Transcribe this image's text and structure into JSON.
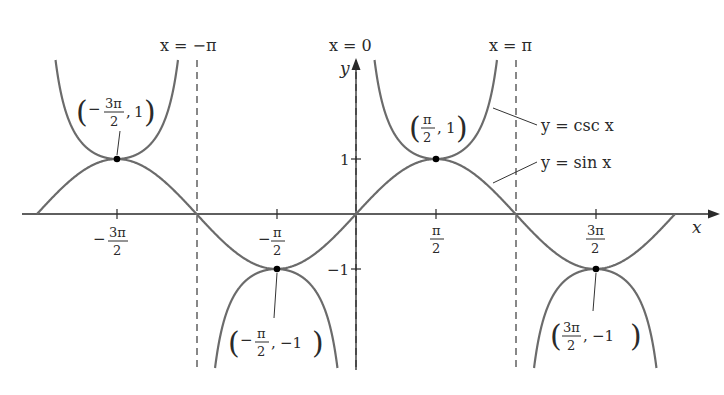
{
  "chart_data": {
    "type": "line",
    "title": "",
    "xlabel": "x",
    "ylabel": "y",
    "xlim": [
      -6.283,
      6.283
    ],
    "ylim": [
      -2.8,
      2.8
    ],
    "grid": false,
    "series": [
      {
        "name": "y = sin x",
        "function": "sin(x)",
        "domain": [
          -6.283,
          6.283
        ],
        "color": "#6b6b6b"
      },
      {
        "name": "y = csc x",
        "function": "1/sin(x)",
        "domain": [
          -6.283,
          6.283
        ],
        "clip_abs_y": 2.8,
        "color": "#6b6b6b"
      }
    ],
    "asymptotes": [
      {
        "label": "x = −π",
        "x": -3.1416
      },
      {
        "label": "x = 0",
        "x": 0
      },
      {
        "label": "x = π",
        "x": 3.1416
      }
    ],
    "x_ticks": [
      {
        "value": -4.712,
        "num": "−3π",
        "den": "2"
      },
      {
        "value": -1.571,
        "num": "−π",
        "den": "2"
      },
      {
        "value": 1.571,
        "num": "π",
        "den": "2"
      },
      {
        "value": 4.712,
        "num": "3π",
        "den": "2"
      }
    ],
    "y_ticks": [
      {
        "value": 1,
        "label": "1"
      },
      {
        "value": -1,
        "label": "−1"
      }
    ],
    "points": [
      {
        "x": -4.712,
        "y": 1,
        "label_num": "3π",
        "label_den": "2",
        "label_sign": "−",
        "label_y": "1"
      },
      {
        "x": -1.571,
        "y": -1,
        "label_num": "π",
        "label_den": "2",
        "label_sign": "−",
        "label_y": "−1"
      },
      {
        "x": 1.571,
        "y": 1,
        "label_num": "π",
        "label_den": "2",
        "label_sign": "",
        "label_y": "1"
      },
      {
        "x": 4.712,
        "y": -1,
        "label_num": "3π",
        "label_den": "2",
        "label_sign": "",
        "label_y": "−1"
      }
    ],
    "legend": [
      {
        "label": "y = csc x"
      },
      {
        "label": "y = sin x"
      }
    ]
  },
  "labels": {
    "asym_neg_pi": "x = −π",
    "asym_zero": "x = 0",
    "asym_pi": "x = π",
    "axis_x": "x",
    "axis_y": "y",
    "ytick_pos": "1",
    "ytick_neg": "−1",
    "legend_csc": "y = csc x",
    "legend_sin": "y = sin x",
    "xtick_m3pi2_num": "3π",
    "xtick_mpi2_num": "π",
    "xtick_pi2_num": "π",
    "xtick_3pi2_num": "3π",
    "den": "2",
    "minus": "−",
    "pt1_y": "1",
    "pt2_y": "−1",
    "pt3_y": "1",
    "pt4_y": "−1"
  },
  "colors": {
    "curve": "#6b6b6b",
    "axis": "#2a2a2a",
    "background": "#ffffff"
  }
}
